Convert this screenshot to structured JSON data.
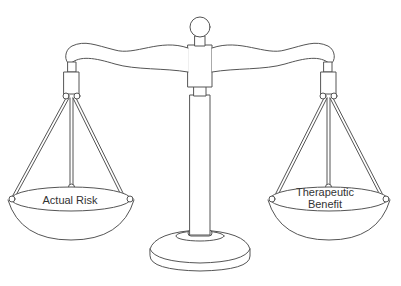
{
  "diagram": {
    "type": "balance-scale",
    "colors": {
      "stroke": "#555555",
      "fill": "#ffffff",
      "text": "#333333"
    },
    "left_pan": {
      "label": "Actual Risk"
    },
    "right_pan": {
      "label_line1": "Therapeutic",
      "label_line2": "Benefit"
    }
  }
}
